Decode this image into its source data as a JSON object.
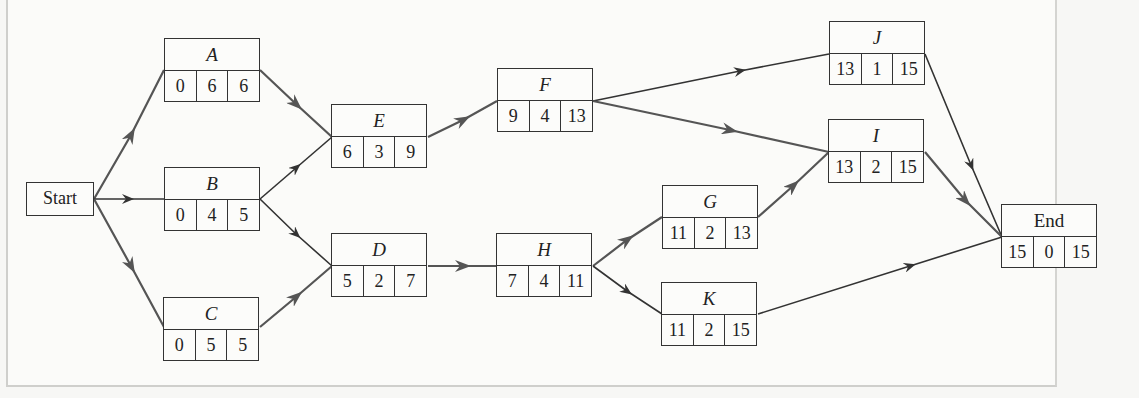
{
  "diagram": {
    "type": "activity-on-node network",
    "start_label": "Start",
    "nodes": {
      "A": {
        "label": "A",
        "es": "0",
        "dur": "6",
        "ef": "6"
      },
      "B": {
        "label": "B",
        "es": "0",
        "dur": "4",
        "ef": "5"
      },
      "C": {
        "label": "C",
        "es": "0",
        "dur": "5",
        "ef": "5"
      },
      "D": {
        "label": "D",
        "es": "5",
        "dur": "2",
        "ef": "7"
      },
      "E": {
        "label": "E",
        "es": "6",
        "dur": "3",
        "ef": "9"
      },
      "F": {
        "label": "F",
        "es": "9",
        "dur": "4",
        "ef": "13"
      },
      "H": {
        "label": "H",
        "es": "7",
        "dur": "4",
        "ef": "11"
      },
      "G": {
        "label": "G",
        "es": "11",
        "dur": "2",
        "ef": "13"
      },
      "K": {
        "label": "K",
        "es": "11",
        "dur": "2",
        "ef": "15"
      },
      "J": {
        "label": "J",
        "es": "13",
        "dur": "1",
        "ef": "15"
      },
      "I": {
        "label": "I",
        "es": "13",
        "dur": "2",
        "ef": "15"
      },
      "End": {
        "label": "End",
        "es": "15",
        "dur": "0",
        "ef": "15"
      }
    },
    "edges": [
      {
        "from": "Start",
        "to": "A"
      },
      {
        "from": "Start",
        "to": "B"
      },
      {
        "from": "Start",
        "to": "C"
      },
      {
        "from": "A",
        "to": "E"
      },
      {
        "from": "B",
        "to": "E"
      },
      {
        "from": "B",
        "to": "D"
      },
      {
        "from": "C",
        "to": "D"
      },
      {
        "from": "E",
        "to": "F"
      },
      {
        "from": "D",
        "to": "H"
      },
      {
        "from": "F",
        "to": "J"
      },
      {
        "from": "F",
        "to": "I"
      },
      {
        "from": "H",
        "to": "G"
      },
      {
        "from": "H",
        "to": "K"
      },
      {
        "from": "G",
        "to": "I"
      },
      {
        "from": "J",
        "to": "End"
      },
      {
        "from": "I",
        "to": "End"
      },
      {
        "from": "K",
        "to": "End"
      }
    ],
    "colors": {
      "line": "#333333",
      "critical_arrow": "#555555",
      "panel": "#fbfbf9"
    }
  }
}
